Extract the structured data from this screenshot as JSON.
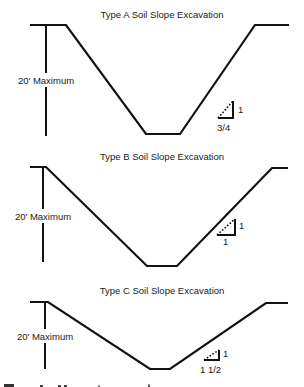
{
  "figure": {
    "panels": [
      {
        "id": "type-a",
        "title": "Type A Soil Slope Excavation",
        "depth_label": "20' Maximum",
        "slope_rise": "1",
        "slope_run": "3/4",
        "profile_points": [
          [
            30,
            25
          ],
          [
            66,
            25
          ],
          [
            146,
            134
          ],
          [
            180,
            134
          ],
          [
            255,
            25
          ],
          [
            289,
            25
          ]
        ],
        "depth_bar": {
          "x": 46,
          "top": 25,
          "label_y": 80,
          "bottom": 136
        },
        "title_pos": [
          162,
          18
        ],
        "triangle": {
          "right_x": 233,
          "top_y": 101,
          "base_y": 118,
          "left_x": 218
        },
        "rise_pos": [
          238,
          113
        ],
        "run_pos": [
          217,
          131
        ]
      },
      {
        "id": "type-b",
        "title": "Type B Soil Slope Excavation",
        "depth_label": "20' Maximum",
        "slope_rise": "1",
        "slope_run": "1",
        "profile_points": [
          [
            30,
            167
          ],
          [
            46,
            167
          ],
          [
            147,
            266
          ],
          [
            177,
            266
          ],
          [
            272,
            168
          ],
          [
            288,
            168
          ]
        ],
        "depth_bar": {
          "x": 43,
          "top": 167,
          "label_y": 216,
          "bottom": 262
        },
        "title_pos": [
          162,
          160
        ],
        "triangle": {
          "right_x": 235,
          "top_y": 219,
          "base_y": 235,
          "left_x": 217
        },
        "rise_pos": [
          239,
          229
        ],
        "run_pos": [
          223,
          245
        ]
      },
      {
        "id": "type-c",
        "title": "Type C Soil Slope Excavation",
        "depth_label": "20' Maximum",
        "slope_rise": "1",
        "slope_run": "1 1/2",
        "profile_points": [
          [
            30,
            302
          ],
          [
            48,
            302
          ],
          [
            150,
            369
          ],
          [
            170,
            369
          ],
          [
            266,
            303
          ],
          [
            288,
            303
          ]
        ],
        "depth_bar": {
          "x": 45,
          "top": 302,
          "label_y": 336,
          "bottom": 369
        },
        "title_pos": [
          162,
          294
        ],
        "triangle": {
          "right_x": 219,
          "top_y": 350,
          "base_y": 360,
          "left_x": 204
        },
        "rise_pos": [
          223,
          357
        ],
        "run_pos": [
          200,
          373
        ]
      }
    ]
  }
}
